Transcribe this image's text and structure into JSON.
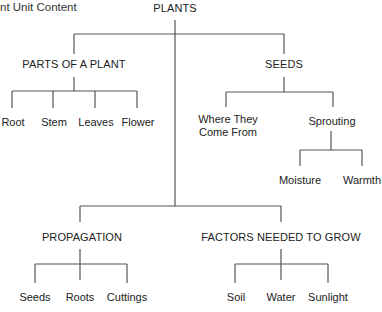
{
  "title": "nt Unit Content",
  "root": {
    "label": "PLANTS"
  },
  "branches": {
    "parts": {
      "label": "PARTS OF A PLANT",
      "children": [
        "Root",
        "Stem",
        "Leaves",
        "Flower"
      ]
    },
    "seeds": {
      "label": "SEEDS",
      "children": {
        "where": "Where They\nCome From",
        "sprouting": "Sprouting"
      },
      "sprouting_children": [
        "Moisture",
        "Warmth"
      ]
    },
    "propagation": {
      "label": "PROPAGATION",
      "children": [
        "Seeds",
        "Roots",
        "Cuttings"
      ]
    },
    "factors": {
      "label": "FACTORS NEEDED TO GROW",
      "children": [
        "Soil",
        "Water",
        "Sunlight"
      ]
    }
  },
  "colors": {
    "line": "#555555",
    "text": "#222222",
    "background": "#ffffff"
  }
}
